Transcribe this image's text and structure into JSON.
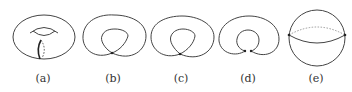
{
  "figure": {
    "panels": [
      {
        "id": "a",
        "label": "(a)",
        "description": "torus with meridian circle"
      },
      {
        "id": "b",
        "label": "(b)",
        "description": "torus cut/pinched, inner loop with crossing"
      },
      {
        "id": "c",
        "label": "(c)",
        "description": "inner loop crossing at bottom"
      },
      {
        "id": "d",
        "label": "(d)",
        "description": "opened curve, gap at bottom"
      },
      {
        "id": "e",
        "label": "(e)",
        "description": "sphere with equator"
      }
    ]
  }
}
